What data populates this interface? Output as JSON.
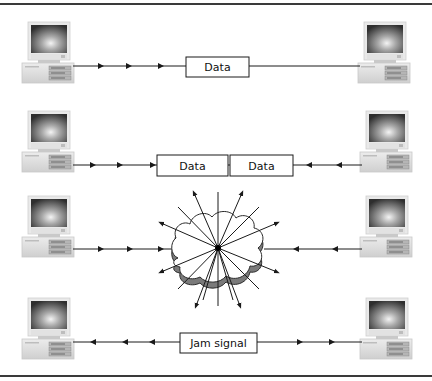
{
  "diagram": {
    "rows": [
      {
        "id": "transmit",
        "boxes": [
          "Data"
        ],
        "direction": "left-to-right"
      },
      {
        "id": "both-transmit",
        "boxes": [
          "Data",
          "Data"
        ],
        "direction": "converging"
      },
      {
        "id": "collision",
        "boxes": [],
        "direction": "burst"
      },
      {
        "id": "jam",
        "boxes": [
          "Jam signal"
        ],
        "direction": "diverging"
      }
    ],
    "labels": {
      "row1_box": "Data",
      "row2_box_left": "Data",
      "row2_box_right": "Data",
      "row4_box": "Jam signal"
    },
    "icons": {
      "computer": "desktop-computer-icon",
      "collision": "cloud-collision-icon"
    },
    "colors": {
      "line": "#1a1a1a",
      "border": "#3a3a3a",
      "cloud_fill": "#ffffff",
      "cloud_shadow": "#777777",
      "screen_dark": "#3a3a3a",
      "screen_light": "#f0f0f0",
      "case": "#dcdcdc"
    }
  }
}
